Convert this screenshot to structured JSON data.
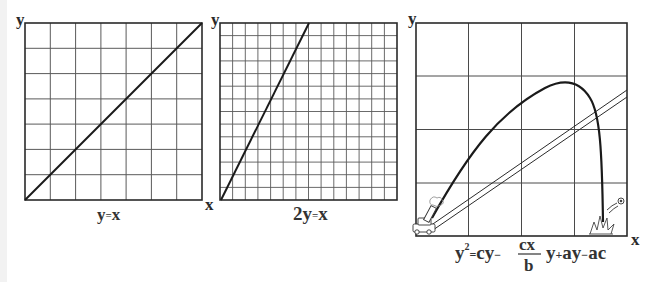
{
  "colors": {
    "grid": "#5a5a5a",
    "frame": "#2a2a2a",
    "curve": "#1a1a1a",
    "background": "#ffffff"
  },
  "panels": [
    {
      "id": "panel-1",
      "caption": "y=x",
      "caption_parts": [
        "y",
        "=",
        "x"
      ],
      "y_label": "y",
      "x_label": "x",
      "grid_divisions": 7
    },
    {
      "id": "panel-2",
      "caption": "2y=x",
      "caption_parts": [
        "2y",
        "=",
        "x"
      ],
      "y_label": "y",
      "x_label": "x",
      "grid_divisions": 14
    },
    {
      "id": "panel-3",
      "caption": "y²=cy−(cx/b)y+ay−ac",
      "caption_parts": {
        "lhs_base": "y",
        "lhs_exp": "2",
        "eq": "=",
        "t1": "cy",
        "minus1": "−",
        "frac_num": "cx",
        "frac_den": "b",
        "t2": "y",
        "plus": "+",
        "t3": "ay",
        "minus2": "−",
        "t4": "ac"
      },
      "y_label": "y",
      "x_label": "x",
      "grid_divisions": 4,
      "illustrations": [
        "cannon-cart",
        "impact-burst",
        "cannonball"
      ]
    }
  ]
}
